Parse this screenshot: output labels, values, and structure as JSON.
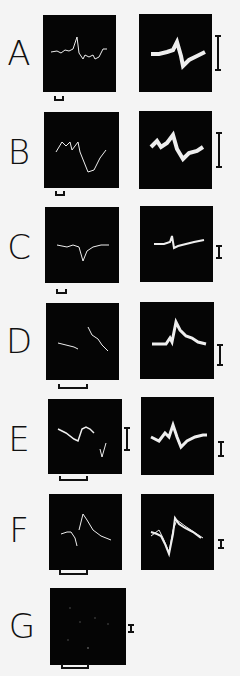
{
  "figure": {
    "rows": [
      {
        "label": "A",
        "left_trace": "spontaneous-and-evoked-response",
        "right_trace": "averaged-superimposed-response"
      },
      {
        "label": "B",
        "left_trace": "evoked-response",
        "right_trace": "superimposed-response"
      },
      {
        "label": "C",
        "left_trace": "evoked-response",
        "right_trace": "superimposed-response"
      },
      {
        "label": "D",
        "left_trace": "evoked-response",
        "right_trace": "superimposed-response"
      },
      {
        "label": "E",
        "left_trace": "evoked-response",
        "right_trace": "superimposed-response"
      },
      {
        "label": "F",
        "left_trace": "evoked-response",
        "right_trace": "superimposed-response"
      },
      {
        "label": "G",
        "left_trace": "no-response",
        "right_trace": null
      }
    ],
    "colors": {
      "background": "#f4f4f4",
      "panel": "#050505",
      "trace": "#f0f0f0",
      "ink": "#111111"
    }
  }
}
